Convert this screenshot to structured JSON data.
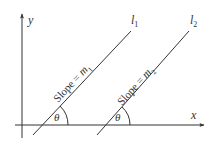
{
  "diagram": {
    "type": "coordinate-geometry",
    "axes": {
      "x_label": "x",
      "y_label": "y"
    },
    "lines": [
      {
        "name": "l",
        "subscript": "1",
        "slope_text": "Slope = ",
        "slope_var": "m",
        "slope_sub": "1",
        "angle_label": "θ"
      },
      {
        "name": "l",
        "subscript": "2",
        "slope_text": "Slope = ",
        "slope_var": "m",
        "slope_sub": "2",
        "angle_label": "θ"
      }
    ],
    "colors": {
      "stroke": "#333333",
      "background": "#ffffff"
    }
  }
}
